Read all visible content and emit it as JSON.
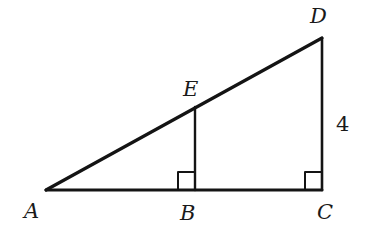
{
  "diagram": {
    "type": "geometry-similar-right-triangles",
    "points": {
      "A": {
        "label": "A",
        "x": 46,
        "y": 190
      },
      "B": {
        "label": "B",
        "x": 195,
        "y": 190
      },
      "C": {
        "label": "C",
        "x": 322,
        "y": 190
      },
      "D": {
        "label": "D",
        "x": 322,
        "y": 38
      },
      "E": {
        "label": "E",
        "x": 195,
        "y": 107
      }
    },
    "segments": [
      "AC",
      "AD",
      "DC",
      "EB"
    ],
    "right_angles": [
      "B",
      "C"
    ],
    "measurements": {
      "DC": "4"
    },
    "colors": {
      "stroke": "#141414",
      "background": "#ffffff"
    }
  }
}
